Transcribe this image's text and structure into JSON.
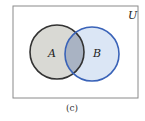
{
  "diagram": {
    "type": "venn",
    "universe_label": "U",
    "sets": [
      {
        "label": "A",
        "fill": "#d9d9d4",
        "stroke": "#333333"
      },
      {
        "label": "B",
        "fill": "#dbe6f5",
        "stroke": "#3a63b8"
      }
    ],
    "intersection_fill": "#a9b3c3",
    "caption": "(c)",
    "border_color": "#888888"
  }
}
